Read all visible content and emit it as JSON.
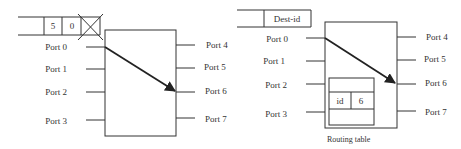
{
  "left_switch": {
    "packet": {
      "cells": [
        "5",
        "0"
      ],
      "crossed_cell": "x-mark"
    },
    "input_ports": [
      "Port 0",
      "Port 1",
      "Port 2",
      "Port 3"
    ],
    "output_ports": [
      "Port 4",
      "Port 5",
      "Port 6",
      "Port 7"
    ],
    "route": {
      "from": "Port 0",
      "to": "Port 6"
    }
  },
  "right_switch": {
    "packet": {
      "header": "Dest-id"
    },
    "input_ports": [
      "Port 0",
      "Port 1",
      "Port 2",
      "Port 3"
    ],
    "output_ports": [
      "Port 4",
      "Port 5",
      "Port 6",
      "Port 7"
    ],
    "route": {
      "from": "Port 0",
      "to": "Port 6"
    },
    "routing_table": {
      "entry_key": "id",
      "entry_value": "6",
      "caption": "Routing table"
    }
  },
  "colors": {
    "line": "#333333",
    "background": "#ffffff"
  }
}
